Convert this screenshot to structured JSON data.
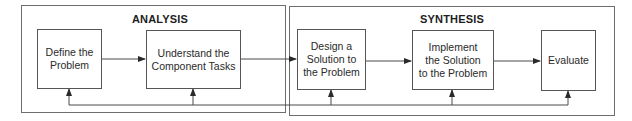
{
  "groups": [
    {
      "id": "analysis",
      "title": "ANALYSIS"
    },
    {
      "id": "synthesis",
      "title": "SYNTHESIS"
    }
  ],
  "steps": [
    {
      "id": "define",
      "label": "Define the\nProblem"
    },
    {
      "id": "understand",
      "label": "Understand the\nComponent Tasks"
    },
    {
      "id": "design",
      "label": "Design a\nSolution to\nthe Problem"
    },
    {
      "id": "implement",
      "label": "Implement\nthe Solution\nto the Problem"
    },
    {
      "id": "evaluate",
      "label": "Evaluate"
    }
  ],
  "flow": [
    {
      "from": "define",
      "to": "understand"
    },
    {
      "from": "understand",
      "to": "design"
    },
    {
      "from": "design",
      "to": "implement"
    },
    {
      "from": "implement",
      "to": "evaluate"
    }
  ],
  "feedback": {
    "targets": [
      "define",
      "understand",
      "design",
      "implement",
      "evaluate"
    ]
  },
  "colors": {
    "line": "#4a4a4a",
    "group_border": "#6e6e6e"
  }
}
